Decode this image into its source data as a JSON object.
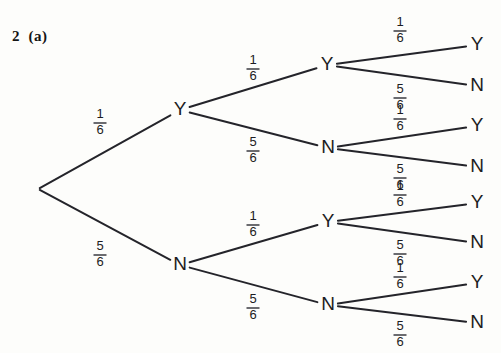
{
  "page": {
    "width": 501,
    "height": 353,
    "background_color": "#fdfdfb",
    "ink_color": "#24242a"
  },
  "question": {
    "label": "2  (a)"
  },
  "tree": {
    "root": {
      "x": 38,
      "y": 189,
      "label": ""
    },
    "level1": [
      {
        "id": "L1-Y",
        "label": "Y",
        "x": 180,
        "y": 110,
        "fraction": {
          "numerator": "1",
          "denominator": "6"
        },
        "label_x": 100,
        "label_y": 122
      },
      {
        "id": "L1-N",
        "label": "N",
        "x": 180,
        "y": 265,
        "fraction": {
          "numerator": "5",
          "denominator": "6"
        },
        "label_x": 100,
        "label_y": 254
      }
    ],
    "level2": [
      {
        "id": "L2-YY",
        "parent": "L1-Y",
        "label": "Y",
        "x": 327,
        "y": 65,
        "fraction": {
          "numerator": "1",
          "denominator": "6"
        },
        "label_x": 253,
        "label_y": 68
      },
      {
        "id": "L2-YN",
        "parent": "L1-Y",
        "label": "N",
        "x": 328,
        "y": 148,
        "fraction": {
          "numerator": "5",
          "denominator": "6"
        },
        "label_x": 253,
        "label_y": 150
      },
      {
        "id": "L2-NY",
        "parent": "L1-N",
        "label": "Y",
        "x": 328,
        "y": 222,
        "fraction": {
          "numerator": "1",
          "denominator": "6"
        },
        "label_x": 253,
        "label_y": 224
      },
      {
        "id": "L2-NN",
        "parent": "L1-N",
        "label": "N",
        "x": 328,
        "y": 305,
        "fraction": {
          "numerator": "5",
          "denominator": "6"
        },
        "label_x": 253,
        "label_y": 307
      }
    ],
    "level3": [
      {
        "id": "L3-YYY",
        "parent": "L2-YY",
        "label": "Y",
        "x": 477,
        "y": 45,
        "fraction": {
          "numerator": "1",
          "denominator": "6"
        },
        "label_x": 400,
        "label_y": 30
      },
      {
        "id": "L3-YYN",
        "parent": "L2-YY",
        "label": "N",
        "x": 477,
        "y": 86,
        "fraction": {
          "numerator": "5",
          "denominator": "6"
        },
        "label_x": 400,
        "label_y": 97
      },
      {
        "id": "L3-YNY",
        "parent": "L2-YN",
        "label": "Y",
        "x": 477,
        "y": 126,
        "fraction": {
          "numerator": "1",
          "denominator": "6"
        },
        "label_x": 400,
        "label_y": 118
      },
      {
        "id": "L3-YNN",
        "parent": "L2-YN",
        "label": "N",
        "x": 477,
        "y": 167,
        "fraction": {
          "numerator": "5",
          "denominator": "6"
        },
        "label_x": 400,
        "label_y": 177
      },
      {
        "id": "L3-NYY",
        "parent": "L2-NY",
        "label": "Y",
        "x": 477,
        "y": 203,
        "fraction": {
          "numerator": "1",
          "denominator": "6"
        },
        "label_x": 400,
        "label_y": 194
      },
      {
        "id": "L3-NYN",
        "parent": "L2-NY",
        "label": "N",
        "x": 477,
        "y": 243,
        "fraction": {
          "numerator": "5",
          "denominator": "6"
        },
        "label_x": 400,
        "label_y": 253
      },
      {
        "id": "L3-NNY",
        "parent": "L2-NN",
        "label": "Y",
        "x": 477,
        "y": 283,
        "fraction": {
          "numerator": "1",
          "denominator": "6"
        },
        "label_x": 400,
        "label_y": 276
      },
      {
        "id": "L3-NNN",
        "parent": "L2-NN",
        "label": "N",
        "x": 477,
        "y": 323,
        "fraction": {
          "numerator": "5",
          "denominator": "6"
        },
        "label_x": 400,
        "label_y": 334
      }
    ]
  },
  "chart_data": {
    "type": "diagram",
    "title": "2  (a)",
    "diagram_kind": "probability-tree",
    "levels": 3,
    "branching_factor": 2,
    "outcome_labels": [
      "Y",
      "N"
    ],
    "branch_probabilities": [
      "1/6",
      "5/6"
    ],
    "paths": [
      {
        "path": [
          "Y",
          "Y",
          "Y"
        ],
        "probabilities": [
          "1/6",
          "1/6",
          "1/6"
        ]
      },
      {
        "path": [
          "Y",
          "Y",
          "N"
        ],
        "probabilities": [
          "1/6",
          "1/6",
          "5/6"
        ]
      },
      {
        "path": [
          "Y",
          "N",
          "Y"
        ],
        "probabilities": [
          "1/6",
          "5/6",
          "1/6"
        ]
      },
      {
        "path": [
          "Y",
          "N",
          "N"
        ],
        "probabilities": [
          "1/6",
          "5/6",
          "5/6"
        ]
      },
      {
        "path": [
          "N",
          "Y",
          "Y"
        ],
        "probabilities": [
          "5/6",
          "1/6",
          "1/6"
        ]
      },
      {
        "path": [
          "N",
          "Y",
          "N"
        ],
        "probabilities": [
          "5/6",
          "1/6",
          "5/6"
        ]
      },
      {
        "path": [
          "N",
          "N",
          "Y"
        ],
        "probabilities": [
          "5/6",
          "5/6",
          "1/6"
        ]
      },
      {
        "path": [
          "N",
          "N",
          "N"
        ],
        "probabilities": [
          "5/6",
          "5/6",
          "5/6"
        ]
      }
    ]
  }
}
